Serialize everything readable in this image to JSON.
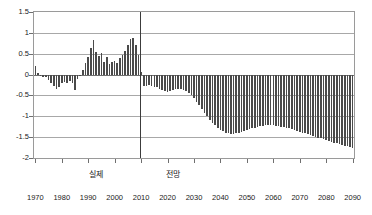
{
  "chart_data": {
    "type": "bar",
    "title": "",
    "subtitle": "",
    "xlabel": "",
    "ylabel": "",
    "ylim": [
      -2,
      1.5
    ],
    "xlim": [
      1970,
      2090
    ],
    "ytick_labels": [
      "1.5",
      "1",
      "0.5",
      "0",
      "-0.5",
      "-1",
      "-1.5",
      "-2"
    ],
    "ytick_values": [
      1.5,
      1,
      0.5,
      0,
      -0.5,
      -1,
      -1.5,
      -2
    ],
    "xtick_labels": [
      "1970",
      "1980",
      "1990",
      "2000",
      "2010",
      "2020",
      "2030",
      "2040",
      "2050",
      "2060",
      "2070",
      "2080",
      "2090"
    ],
    "xtick_values": [
      1970,
      1980,
      1990,
      2000,
      2010,
      2020,
      2030,
      2040,
      2050,
      2060,
      2070,
      2080,
      2090
    ],
    "grid": true,
    "grid_axis": "y",
    "legend": false,
    "bar_color": "#4a4a4a",
    "grid_color": "#a8a8a8",
    "axis_color": "#6f6f6f",
    "divider_x": 2010,
    "annotations": [
      {
        "name": "actual-region-label",
        "text": "실제",
        "x": 1993
      },
      {
        "name": "forecast-region-label",
        "text": "전망",
        "x": 2022
      }
    ],
    "x": [
      1970,
      1971,
      1972,
      1973,
      1974,
      1975,
      1976,
      1977,
      1978,
      1979,
      1980,
      1981,
      1982,
      1983,
      1984,
      1985,
      1986,
      1987,
      1988,
      1989,
      1990,
      1991,
      1992,
      1993,
      1994,
      1995,
      1996,
      1997,
      1998,
      1999,
      2000,
      2001,
      2002,
      2003,
      2004,
      2005,
      2006,
      2007,
      2008,
      2009,
      2010,
      2011,
      2012,
      2013,
      2014,
      2015,
      2016,
      2017,
      2018,
      2019,
      2020,
      2021,
      2022,
      2023,
      2024,
      2025,
      2026,
      2027,
      2028,
      2029,
      2030,
      2031,
      2032,
      2033,
      2034,
      2035,
      2036,
      2037,
      2038,
      2039,
      2040,
      2041,
      2042,
      2043,
      2044,
      2045,
      2046,
      2047,
      2048,
      2049,
      2050,
      2051,
      2052,
      2053,
      2054,
      2055,
      2056,
      2057,
      2058,
      2059,
      2060,
      2061,
      2062,
      2063,
      2064,
      2065,
      2066,
      2067,
      2068,
      2069,
      2070,
      2071,
      2072,
      2073,
      2074,
      2075,
      2076,
      2077,
      2078,
      2079,
      2080,
      2081,
      2082,
      2083,
      2084,
      2085,
      2086,
      2087,
      2088,
      2089,
      2090
    ],
    "values": [
      0.21,
      0.04,
      -0.03,
      -0.05,
      -0.06,
      -0.12,
      -0.2,
      -0.27,
      -0.35,
      -0.3,
      -0.2,
      -0.17,
      -0.21,
      -0.16,
      -0.2,
      -0.38,
      -0.1,
      -0.03,
      0.12,
      0.28,
      0.42,
      0.63,
      0.84,
      0.55,
      0.44,
      0.52,
      0.3,
      0.42,
      0.26,
      0.31,
      0.33,
      0.28,
      0.4,
      0.47,
      0.56,
      0.72,
      0.85,
      0.88,
      0.72,
      0.48,
      0.05,
      -0.27,
      -0.27,
      -0.26,
      -0.28,
      -0.29,
      -0.31,
      -0.34,
      -0.37,
      -0.39,
      -0.43,
      -0.4,
      -0.37,
      -0.35,
      -0.34,
      -0.34,
      -0.36,
      -0.39,
      -0.44,
      -0.5,
      -0.57,
      -0.65,
      -0.74,
      -0.83,
      -0.92,
      -1.0,
      -1.08,
      -1.15,
      -1.21,
      -1.27,
      -1.32,
      -1.36,
      -1.39,
      -1.41,
      -1.42,
      -1.42,
      -1.41,
      -1.4,
      -1.38,
      -1.36,
      -1.34,
      -1.31,
      -1.29,
      -1.27,
      -1.25,
      -1.24,
      -1.23,
      -1.22,
      -1.22,
      -1.22,
      -1.22,
      -1.23,
      -1.24,
      -1.25,
      -1.26,
      -1.28,
      -1.29,
      -1.31,
      -1.33,
      -1.35,
      -1.37,
      -1.39,
      -1.41,
      -1.43,
      -1.45,
      -1.47,
      -1.49,
      -1.51,
      -1.53,
      -1.55,
      -1.57,
      -1.59,
      -1.61,
      -1.63,
      -1.65,
      -1.67,
      -1.69,
      -1.71,
      -1.72,
      -1.74,
      -1.75
    ]
  }
}
